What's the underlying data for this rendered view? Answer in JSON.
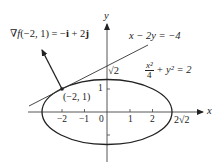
{
  "diagram": {
    "axes": {
      "x_label": "x",
      "y_label": "y",
      "origin_label": "0",
      "x_ticks": [
        "−2",
        "−1",
        "1",
        "2"
      ],
      "y_ticks": [
        "1"
      ],
      "x_intercept_label": "2√2",
      "y_intercept_label": "√2"
    },
    "ellipse": {
      "equation_lhs_num": "x²",
      "equation_lhs_den": "4",
      "equation_rest": "+ y² = 2",
      "semi_major_x": "2√2",
      "semi_minor_y": "√2"
    },
    "tangent_line": {
      "equation": "x − 2y = −4"
    },
    "point": {
      "label": "(−2, 1)"
    },
    "gradient": {
      "label_prefix": "∇",
      "label_f": "f",
      "label_args": "(−2, 1) = −",
      "label_i": "i",
      "label_mid": " + 2",
      "label_j": "j"
    },
    "colors": {
      "stroke": "#222222",
      "text": "#222222",
      "background": "#ffffff"
    }
  }
}
